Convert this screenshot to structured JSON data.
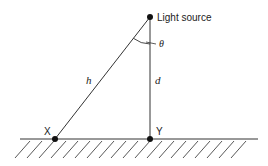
{
  "diagram": {
    "labels": {
      "light_source": "Light source",
      "theta": "θ",
      "h": "h",
      "d": "d",
      "x": "X",
      "y": "Y"
    },
    "points": {
      "light_source": [
        150,
        17
      ],
      "x": [
        55,
        139
      ],
      "y": [
        150,
        139
      ]
    },
    "ground": {
      "y": 139,
      "x1": 20,
      "x2": 258
    },
    "colors": {
      "line": "#333333",
      "dot": "#111111"
    }
  }
}
